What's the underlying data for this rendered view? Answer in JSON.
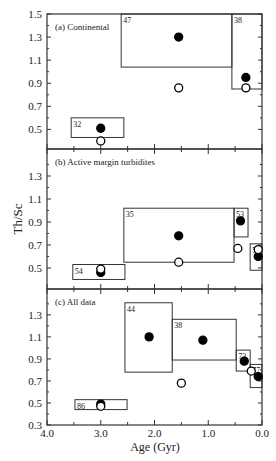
{
  "figure": {
    "ylabel": "Th/Sc",
    "xlabel": "Age (Gyr)",
    "xticks": [
      "4.0",
      "3.0",
      "2.0",
      "1.0",
      "0.0"
    ]
  },
  "chart_data": [
    {
      "type": "scatter",
      "title": "(a) Continental",
      "xlabel": "Age (Gyr)",
      "ylabel": "Th/Sc",
      "xlim": [
        4.0,
        0.0
      ],
      "ylim": [
        0.33,
        1.5
      ],
      "yticks": [
        0.5,
        0.7,
        0.9,
        1.1,
        1.3,
        1.5
      ],
      "boxes": [
        {
          "label": "32",
          "x": [
            3.55,
            2.57
          ],
          "y": [
            0.43,
            0.6
          ]
        },
        {
          "label": "47",
          "x": [
            2.62,
            0.56
          ],
          "y": [
            1.04,
            1.5
          ]
        },
        {
          "label": "38",
          "x": [
            0.56,
            0.0
          ],
          "y": [
            0.85,
            1.5
          ]
        }
      ],
      "series": [
        {
          "name": "filled",
          "points": [
            [
              3.0,
              0.51
            ],
            [
              1.55,
              1.3
            ],
            [
              0.3,
              0.95
            ]
          ]
        },
        {
          "name": "open",
          "points": [
            [
              3.0,
              0.4
            ],
            [
              1.55,
              0.86
            ],
            [
              0.3,
              0.86
            ]
          ]
        }
      ]
    },
    {
      "type": "scatter",
      "title": "(b) Active margin turbidites",
      "xlabel": "Age (Gyr)",
      "ylabel": "Th/Sc",
      "xlim": [
        4.0,
        0.0
      ],
      "ylim": [
        0.317,
        1.535
      ],
      "yticks": [
        0.5,
        0.7,
        0.9,
        1.1,
        1.3
      ],
      "boxes": [
        {
          "label": "54",
          "x": [
            3.52,
            2.55
          ],
          "y": [
            0.4,
            0.53
          ]
        },
        {
          "label": "35",
          "x": [
            2.57,
            0.52
          ],
          "y": [
            0.55,
            1.02
          ]
        },
        {
          "label": "53",
          "x": [
            0.52,
            0.26
          ],
          "y": [
            0.77,
            1.02
          ]
        },
        {
          "label": "59",
          "x": [
            0.22,
            0.0
          ],
          "y": [
            0.48,
            0.71
          ]
        }
      ],
      "series": [
        {
          "name": "filled",
          "points": [
            [
              3.0,
              0.46
            ],
            [
              1.55,
              0.78
            ],
            [
              0.4,
              0.91
            ],
            [
              0.07,
              0.6
            ]
          ]
        },
        {
          "name": "open",
          "points": [
            [
              3.0,
              0.49
            ],
            [
              1.55,
              0.55
            ],
            [
              0.45,
              0.67
            ],
            [
              0.07,
              0.66
            ]
          ]
        }
      ]
    },
    {
      "type": "scatter",
      "title": "(c) All data",
      "xlabel": "Age (Gyr)",
      "ylabel": "Th/Sc",
      "xlim": [
        4.0,
        0.0
      ],
      "ylim": [
        0.3,
        1.535
      ],
      "yticks": [
        0.3,
        0.5,
        0.7,
        0.9,
        1.1,
        1.3
      ],
      "boxes": [
        {
          "label": "86",
          "x": [
            3.48,
            2.51
          ],
          "y": [
            0.44,
            0.53
          ]
        },
        {
          "label": "44",
          "x": [
            2.55,
            1.67
          ],
          "y": [
            0.78,
            1.41
          ]
        },
        {
          "label": "38",
          "x": [
            1.67,
            0.48
          ],
          "y": [
            0.89,
            1.26
          ]
        },
        {
          "label": "73",
          "x": [
            0.48,
            0.22
          ],
          "y": [
            0.79,
            0.98
          ]
        },
        {
          "label": "77",
          "x": [
            0.22,
            0.0
          ],
          "y": [
            0.64,
            0.85
          ]
        }
      ],
      "series": [
        {
          "name": "filled",
          "points": [
            [
              3.0,
              0.49
            ],
            [
              2.1,
              1.1
            ],
            [
              1.1,
              1.07
            ],
            [
              0.33,
              0.88
            ],
            [
              0.07,
              0.74
            ]
          ]
        },
        {
          "name": "open",
          "points": [
            [
              3.0,
              0.47
            ],
            [
              1.5,
              0.68
            ],
            [
              0.2,
              0.79
            ]
          ]
        }
      ]
    }
  ]
}
